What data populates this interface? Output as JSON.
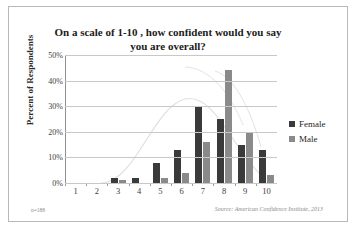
{
  "chart_data": {
    "type": "bar",
    "title": "On a scale of 1-10 , how confident would you say you are overall?",
    "title_line1": "On a scale of 1-10 , how confident would you say",
    "title_line2": "you are overall?",
    "xlabel": "",
    "ylabel": "Percent of Respondents",
    "categories": [
      "1",
      "2",
      "3",
      "4",
      "5",
      "6",
      "7",
      "8",
      "9",
      "10"
    ],
    "series": [
      {
        "name": "Female",
        "color": "#3a3a3a",
        "values": [
          0,
          0,
          2,
          2,
          8,
          13,
          30,
          25,
          15,
          13
        ]
      },
      {
        "name": "Male",
        "color": "#8a8a8a",
        "values": [
          0,
          0,
          1,
          0,
          2,
          4,
          16,
          44,
          20,
          3
        ]
      }
    ],
    "ylim": [
      0,
      50
    ],
    "yticks": [
      "0%",
      "10%",
      "20%",
      "30%",
      "40%",
      "50%"
    ],
    "ytick_values": [
      0,
      10,
      20,
      30,
      40,
      50
    ],
    "grid": true,
    "legend_position": "right"
  },
  "notes": {
    "sample_size": "n=188",
    "source": "Source: American Confidence Institute, 2013"
  }
}
